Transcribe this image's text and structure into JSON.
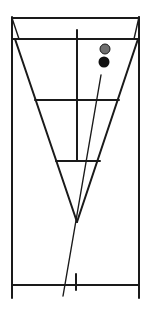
{
  "diagram": {
    "title": "",
    "colors": {
      "line": "#1a1a1a",
      "circle_upper": "#6e6e6e",
      "circle_lower": "#111111",
      "background": "#ffffff"
    },
    "elements": [
      {
        "id": "outer-frame",
        "kind": "frame"
      },
      {
        "id": "inverted-triangle",
        "kind": "triangle"
      },
      {
        "id": "horizontal-divider-upper",
        "kind": "line"
      },
      {
        "id": "horizontal-divider-lower",
        "kind": "line"
      },
      {
        "id": "center-vertical-line",
        "kind": "line"
      },
      {
        "id": "slanted-line",
        "kind": "line"
      },
      {
        "id": "circle-upper",
        "kind": "circle",
        "fill": "grey"
      },
      {
        "id": "circle-lower",
        "kind": "circle",
        "fill": "black"
      },
      {
        "id": "bottom-tick",
        "kind": "tick"
      }
    ]
  }
}
